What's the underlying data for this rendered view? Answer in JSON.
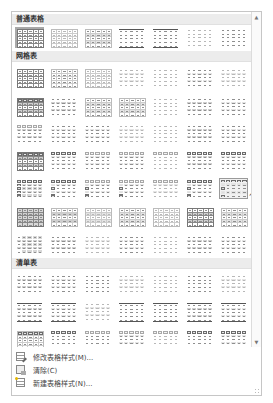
{
  "gallery": {
    "sections": [
      {
        "title": "普通表格",
        "rows": 1
      },
      {
        "title": "网格表",
        "rows": 7
      },
      {
        "title": "清单表",
        "rows": 3
      }
    ],
    "selected_style": "普通表格-1",
    "hovered_style": "网格表-row5-col7"
  },
  "scrollbar": {
    "up_icon": "▲",
    "down_icon": "▼"
  },
  "menu": {
    "items": [
      {
        "label": "修改表格样式(M)...",
        "icon": "edit-table-style-icon"
      },
      {
        "label": "清除(C)",
        "icon": "clear-table-icon"
      },
      {
        "label": "新建表格样式(N)...",
        "icon": "new-table-style-icon"
      }
    ]
  }
}
